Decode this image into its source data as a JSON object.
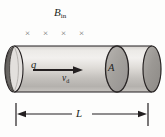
{
  "figure": {
    "background_color": "#fdfdfc",
    "ink_color": "#231f20",
    "field_mark_color": "#6f6c6a"
  },
  "labels": {
    "magnetic_field": {
      "symbol": "B",
      "subscript": "in",
      "text": "B"
    },
    "charge": "q",
    "drift_velocity": {
      "symbol": "v",
      "subscript": "d",
      "text": "v"
    },
    "area": "A",
    "length": "L"
  },
  "field_marks": {
    "glyph": "×",
    "count": 4,
    "positions_x": [
      25,
      43,
      61,
      79
    ],
    "position_y": 29,
    "meaning": "magnetic-field-into-page"
  },
  "cylinder": {
    "left_x": 14,
    "right_x": 152,
    "top_y": 46,
    "bottom_y": 92,
    "cap_rx": 9,
    "cross_section_x": 117,
    "body_fill_light": "#e7e5e2",
    "body_fill_mid": "#cfcdc9",
    "body_fill_dark": "#a9a6a1",
    "cap_fill": "#9c9995",
    "outline_color": "#231f20"
  },
  "drift_arrow": {
    "start_x": 33,
    "end_x": 83,
    "y": 70,
    "color": "#231f20"
  },
  "dimension_line": {
    "label": "L",
    "left_x": 16,
    "right_x": 148,
    "y": 114,
    "tick_top_y": 103,
    "tick_bottom_y": 126,
    "color": "#231f20"
  }
}
